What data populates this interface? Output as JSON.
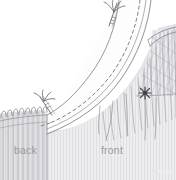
{
  "figure": {
    "type": "technical-sewing-illustration",
    "background_color": "#ffffff",
    "line_color": "#8c8c92",
    "fabric_tone": "#e9e9ec",
    "shadow_tone": "#d2d2d6",
    "label_color": "#9a9a9a",
    "accent_mark_color": "#4a4a4e"
  },
  "labels": {
    "back": "back",
    "front": "front"
  },
  "caption": {
    "text": "fig."
  },
  "elements": {
    "waistband": "curved-waistband-piece",
    "stitch_line": "dashed-basting-stitch-line",
    "pin_upper": "straight-pin-with-thread-upper",
    "pin_lower": "straight-pin-with-thread-lower",
    "gathers_back": "gathered-loops-back-panel",
    "gathers_front": "gathered-threads-front-panel",
    "hatching": "cross-hatched-shading-right",
    "knot_mark": "thread-knot-starburst",
    "side_seam": "vertical-side-seam-line",
    "fold_edge": "folded-hem-edge-top-right"
  }
}
